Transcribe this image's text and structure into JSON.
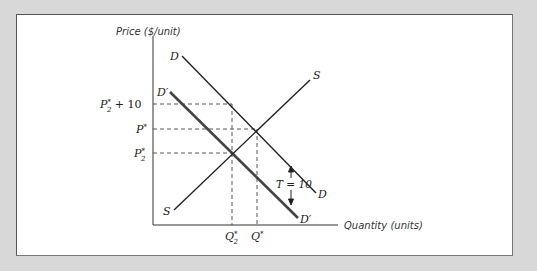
{
  "diagram": {
    "y_axis_label": "Price ($/unit)",
    "x_axis_label": "Quantity (units)",
    "curves": {
      "demand": {
        "label": "D",
        "label_end": "D"
      },
      "demand_shifted": {
        "label": "D′",
        "label_end": "D′"
      },
      "supply": {
        "label": "S",
        "label_end": "S"
      }
    },
    "price_labels": {
      "p2_plus_10": {
        "base": "P",
        "sup": "*",
        "sub": "2",
        "suffix": " + 10"
      },
      "p_star": {
        "base": "P",
        "sup": "*"
      },
      "p2_star": {
        "base": "P",
        "sup": "*",
        "sub": "2"
      }
    },
    "quantity_labels": {
      "q2_star": {
        "base": "Q",
        "sup": "*",
        "sub": "2"
      },
      "q_star": {
        "base": "Q",
        "sup": "*"
      }
    },
    "tax_annotation": "T = 10",
    "colors": {
      "background": "#d8d8d8",
      "panel": "#ffffff",
      "line": "#222222",
      "shifted_demand": "#444444"
    }
  }
}
